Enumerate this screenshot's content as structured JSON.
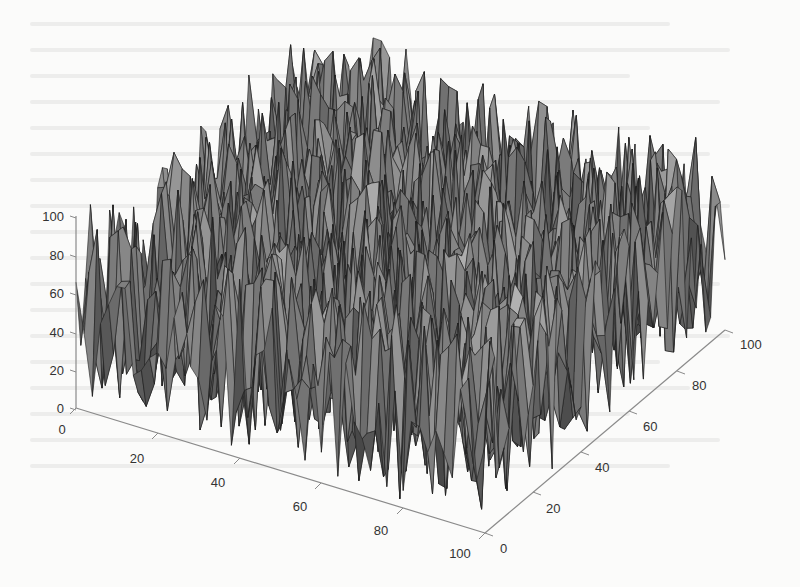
{
  "chart_data": {
    "type": "surface3d",
    "title": "",
    "xlabel": "",
    "ylabel": "",
    "zlabel": "",
    "x_ticks": [
      "0",
      "20",
      "40",
      "60",
      "80",
      "100"
    ],
    "y_ticks": [
      "0",
      "20",
      "40",
      "60",
      "80",
      "100"
    ],
    "z_ticks": [
      "0",
      "20",
      "40",
      "60",
      "80",
      "100"
    ],
    "xlim": [
      0,
      100
    ],
    "ylim": [
      0,
      100
    ],
    "zlim": [
      0,
      100
    ],
    "grid": false,
    "legend": null,
    "colormap": "gray",
    "colors": {
      "face_light": "#9a9a9a",
      "face_dark": "#3a3a3a",
      "edge": "#1e1e1e",
      "axis": "#8a8a8a",
      "text": "#333333"
    }
  }
}
